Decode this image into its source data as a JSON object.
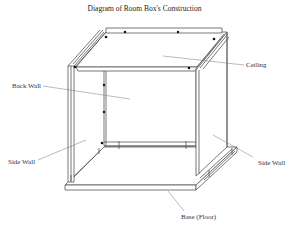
{
  "title": "Diagram of Room Box's Construction",
  "labels": {
    "ceiling": "Ceiling",
    "back_wall": "Back Wall",
    "side_wall_left": "Side Wall",
    "side_wall_right": "Side Wall",
    "base": "Base (Floor)"
  },
  "colors": {
    "line": "#555555",
    "leader": "#777777",
    "fastener": "#111111",
    "background": "#ffffff"
  }
}
